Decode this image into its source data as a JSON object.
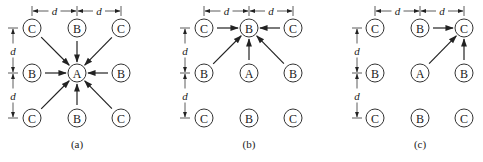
{
  "figure": {
    "node_radius": 9,
    "row_y": [
      28,
      73,
      118
    ],
    "grid_labels": [
      [
        "C",
        "B",
        "C"
      ],
      [
        "B",
        "A",
        "B"
      ],
      [
        "C",
        "B",
        "C"
      ]
    ],
    "spacing_label": "d",
    "caption_y": 148,
    "dim_h_y": 11,
    "panels": [
      {
        "id": "a",
        "caption": "(a)",
        "col_x": [
          32,
          77,
          121
        ],
        "dim_v_x": 13,
        "target": [
          1,
          1
        ],
        "sources": [
          [
            0,
            0
          ],
          [
            0,
            1
          ],
          [
            0,
            2
          ],
          [
            1,
            0
          ],
          [
            1,
            2
          ],
          [
            2,
            0
          ],
          [
            2,
            1
          ],
          [
            2,
            2
          ]
        ]
      },
      {
        "id": "b",
        "caption": "(b)",
        "col_x": [
          204,
          249,
          293
        ],
        "dim_v_x": 185,
        "target": [
          0,
          1
        ],
        "sources": [
          [
            0,
            0
          ],
          [
            0,
            2
          ],
          [
            1,
            0
          ],
          [
            1,
            1
          ],
          [
            1,
            2
          ]
        ]
      },
      {
        "id": "c",
        "caption": "(c)",
        "col_x": [
          375,
          420,
          464
        ],
        "dim_v_x": 357,
        "target": [
          0,
          2
        ],
        "sources": [
          [
            0,
            1
          ],
          [
            1,
            1
          ],
          [
            1,
            2
          ]
        ]
      }
    ]
  }
}
